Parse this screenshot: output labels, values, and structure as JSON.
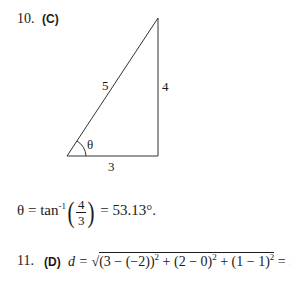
{
  "problems": [
    {
      "number": "10.",
      "answer": "(C)",
      "figure": {
        "type": "right-triangle",
        "hypotenuse_label": "5",
        "vertical_leg_label": "4",
        "horizontal_leg_label": "3",
        "angle_label": "θ"
      },
      "solution": {
        "lhs": "θ = tan",
        "exponent": "-1",
        "numerator": "4",
        "denominator": "3",
        "rhs": "= 53.13°."
      }
    },
    {
      "number": "11.",
      "answer": "(D)",
      "solution": {
        "lhs": "d =",
        "radicand_part1": "(3 − (−2))",
        "exp1": "2",
        "radicand_part2": " + (2 − 0)",
        "exp2": "2",
        "radicand_part3": " + (1 − 1)",
        "exp3": "2",
        "rhs": "= 5.4"
      }
    }
  ]
}
